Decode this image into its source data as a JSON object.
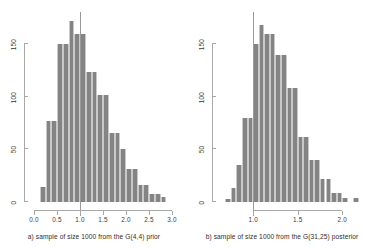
{
  "figure": {
    "background": "#ffffff",
    "bar_color": "#848484",
    "axis_color": "#a8a8a8",
    "refline_color": "#9a9a9a"
  },
  "panels": [
    {
      "id": "panel-a",
      "caption": "a) sample of size 1000 from the G(4,4) prior",
      "chart_data": {
        "type": "bar",
        "title": "",
        "subtitle": "",
        "xlabel": "",
        "ylabel": "",
        "xlim": [
          0.0,
          3.0
        ],
        "ylim": [
          0,
          175
        ],
        "xticks": [
          0.0,
          0.5,
          1.0,
          1.5,
          2.0,
          2.5,
          3.0
        ],
        "xticklabels": [
          "0.0",
          "0.5",
          "1.0",
          "1.5",
          "2.0",
          "2.5",
          "3.0"
        ],
        "yticks": [
          0,
          50,
          100,
          150
        ],
        "yticklabels": [
          "0",
          "50",
          "100",
          "150"
        ],
        "grid": false,
        "legend": "none",
        "bin_width": 0.125,
        "bin_edges": [
          0.125,
          0.25,
          0.375,
          0.5,
          0.625,
          0.75,
          0.875,
          1.0,
          1.125,
          1.25,
          1.375,
          1.5,
          1.625,
          1.75,
          1.875,
          2.0,
          2.125,
          2.25,
          2.375,
          2.5,
          2.625,
          2.75,
          2.875
        ],
        "categories": [
          "0.125-0.25",
          "0.25-0.375",
          "0.375-0.5",
          "0.5-0.625",
          "0.625-0.75",
          "0.75-0.875",
          "0.875-1.0",
          "1.0-1.125",
          "1.125-1.25",
          "1.25-1.375",
          "1.375-1.5",
          "1.5-1.625",
          "1.625-1.75",
          "1.75-1.875",
          "1.875-2.0",
          "2.0-2.125",
          "2.125-2.25",
          "2.25-2.375",
          "2.375-2.5",
          "2.5-2.625",
          "2.625-2.75",
          "2.75-2.875"
        ],
        "values": [
          14,
          77,
          77,
          150,
          150,
          172,
          160,
          160,
          124,
          124,
          102,
          102,
          66,
          66,
          50,
          31,
          31,
          16,
          16,
          8,
          8,
          5
        ],
        "annotations": [
          {
            "type": "vertical-line",
            "x": 1.0,
            "label": "reference line at 1.0"
          }
        ]
      }
    },
    {
      "id": "panel-b",
      "caption": "b) sample of size 1000 from the G(31,25) posterior",
      "chart_data": {
        "type": "bar",
        "title": "",
        "subtitle": "",
        "xlabel": "",
        "ylabel": "",
        "xlim": [
          0.65,
          2.2
        ],
        "ylim": [
          0,
          175
        ],
        "xticks": [
          1.0,
          1.5,
          2.0
        ],
        "xticklabels": [
          "1.0",
          "1.5",
          "2.0"
        ],
        "yticks": [
          0,
          50,
          100,
          150
        ],
        "yticklabels": [
          "0",
          "50",
          "100",
          "150"
        ],
        "grid": false,
        "legend": "none",
        "bin_width": 0.0625,
        "bin_edges": [
          0.6875,
          0.75,
          0.8125,
          0.875,
          0.9375,
          1.0,
          1.0625,
          1.125,
          1.1875,
          1.25,
          1.3125,
          1.375,
          1.4375,
          1.5,
          1.5625,
          1.625,
          1.6875,
          1.75,
          1.8125,
          1.875,
          1.9375,
          2.0,
          2.0625,
          2.125,
          2.1875
        ],
        "categories": [
          "0.6875-0.75",
          "0.75-0.8125",
          "0.8125-0.875",
          "0.875-0.9375",
          "0.9375-1.0",
          "1.0-1.0625",
          "1.0625-1.125",
          "1.125-1.1875",
          "1.1875-1.25",
          "1.25-1.3125",
          "1.3125-1.375",
          "1.375-1.4375",
          "1.4375-1.5",
          "1.5-1.5625",
          "1.5625-1.625",
          "1.625-1.6875",
          "1.6875-1.75",
          "1.75-1.8125",
          "1.8125-1.875",
          "1.875-1.9375",
          "1.9375-2.0",
          "2.0-2.0625",
          "2.0625-2.125",
          "2.125-2.1875"
        ],
        "values": [
          3,
          13,
          35,
          80,
          80,
          150,
          168,
          160,
          160,
          140,
          140,
          108,
          108,
          62,
          62,
          40,
          40,
          22,
          22,
          9,
          9,
          4,
          0,
          4
        ],
        "annotations": [
          {
            "type": "vertical-line",
            "x": 1.0,
            "label": "reference line at 1.0"
          }
        ]
      }
    }
  ]
}
